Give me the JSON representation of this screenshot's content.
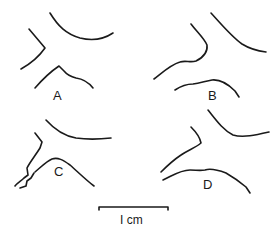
{
  "figure": {
    "panels": [
      {
        "id": "A",
        "label": "A"
      },
      {
        "id": "B",
        "label": "B"
      },
      {
        "id": "C",
        "label": "C"
      },
      {
        "id": "D",
        "label": "D"
      }
    ],
    "scale_bar": {
      "label": "I cm"
    }
  }
}
